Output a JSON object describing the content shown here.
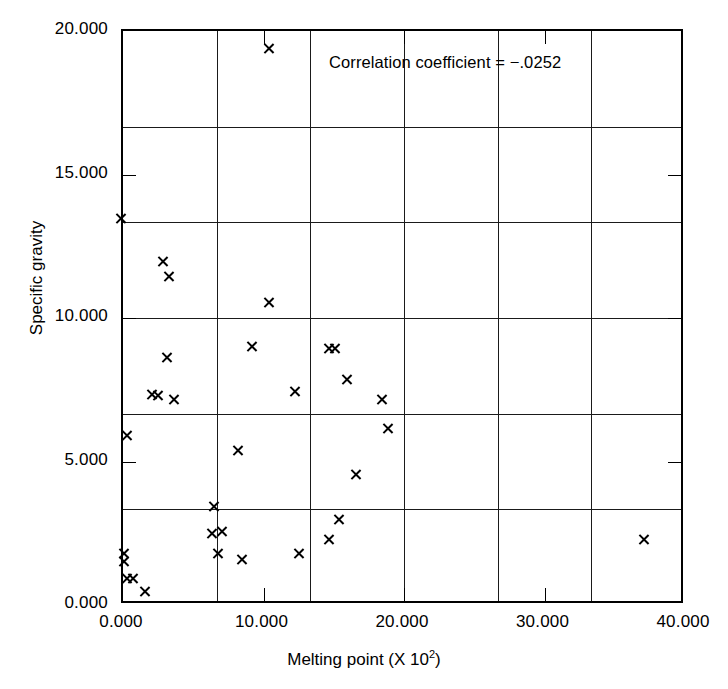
{
  "chart_data": {
    "type": "scatter",
    "title": "",
    "xlabel": "Melting point (X 10",
    "xlabel_exponent": "2",
    "xlabel_suffix": ")",
    "ylabel": "Specific gravity",
    "xlim": [
      0,
      40
    ],
    "ylim": [
      0,
      20
    ],
    "xticks": [
      0,
      10,
      20,
      30,
      40
    ],
    "yticks": [
      0,
      5,
      10,
      15,
      20
    ],
    "xtick_labels": [
      "0.000",
      "10.000",
      "20.000",
      "30.000",
      "40.000"
    ],
    "ytick_labels": [
      "0.000",
      "5.000",
      "10.000",
      "15.000",
      "20.000"
    ],
    "grid": true,
    "grid_x_values": [
      6.67,
      13.33,
      20.0,
      26.67,
      33.33
    ],
    "grid_y_values": [
      3.33,
      6.67,
      10.0,
      13.33,
      16.67
    ],
    "marker": "x",
    "marker_color": "#000000",
    "legend": "none",
    "annotations": [
      {
        "name": "correlation-coefficient",
        "text": "Correlation coefficient = −.0252",
        "x": 14.8,
        "y": 18.2
      }
    ],
    "points": [
      {
        "x": 0.0,
        "y": 13.4
      },
      {
        "x": 0.2,
        "y": 1.74
      },
      {
        "x": 0.2,
        "y": 1.43
      },
      {
        "x": 0.4,
        "y": 5.84
      },
      {
        "x": 0.4,
        "y": 0.85
      },
      {
        "x": 0.85,
        "y": 0.85
      },
      {
        "x": 1.7,
        "y": 0.4
      },
      {
        "x": 2.2,
        "y": 7.25
      },
      {
        "x": 2.6,
        "y": 7.23
      },
      {
        "x": 3.0,
        "y": 11.9
      },
      {
        "x": 3.3,
        "y": 8.57
      },
      {
        "x": 3.4,
        "y": 11.37
      },
      {
        "x": 3.8,
        "y": 7.08
      },
      {
        "x": 6.5,
        "y": 2.42
      },
      {
        "x": 6.6,
        "y": 3.35
      },
      {
        "x": 6.9,
        "y": 1.73
      },
      {
        "x": 7.2,
        "y": 2.48
      },
      {
        "x": 8.3,
        "y": 5.31
      },
      {
        "x": 8.6,
        "y": 1.5
      },
      {
        "x": 9.3,
        "y": 8.93
      },
      {
        "x": 10.5,
        "y": 10.46
      },
      {
        "x": 10.5,
        "y": 19.32
      },
      {
        "x": 12.4,
        "y": 7.38
      },
      {
        "x": 12.7,
        "y": 1.74
      },
      {
        "x": 14.8,
        "y": 8.88
      },
      {
        "x": 14.8,
        "y": 2.22
      },
      {
        "x": 15.2,
        "y": 8.88
      },
      {
        "x": 15.5,
        "y": 2.92
      },
      {
        "x": 16.1,
        "y": 7.8
      },
      {
        "x": 16.7,
        "y": 4.46
      },
      {
        "x": 18.6,
        "y": 7.1
      },
      {
        "x": 19.0,
        "y": 6.08
      },
      {
        "x": 37.2,
        "y": 2.22
      }
    ]
  }
}
